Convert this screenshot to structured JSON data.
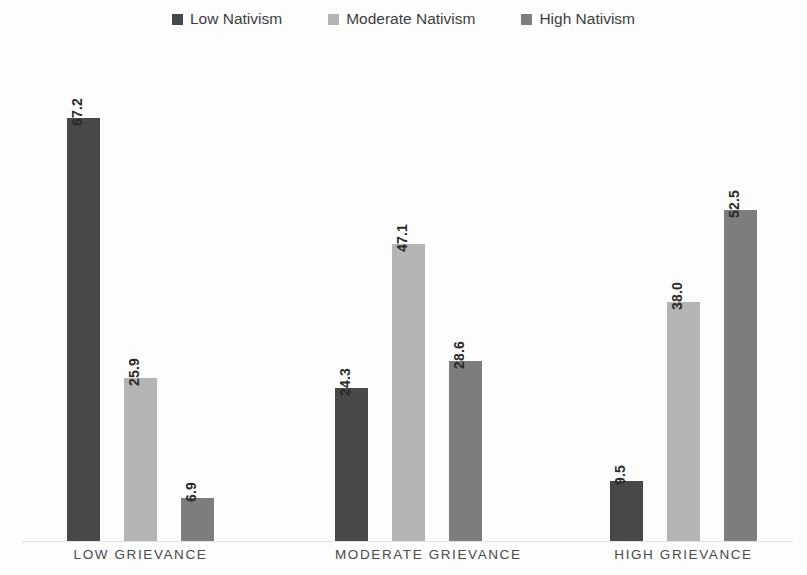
{
  "chart_data": {
    "type": "bar",
    "title": "",
    "subtitle": "",
    "xlabel": "",
    "ylabel": "",
    "grid": false,
    "legend_position": "top-center",
    "value_label_rotation": "vertical",
    "ylim": [
      0,
      70
    ],
    "categories": [
      "LOW GRIEVANCE",
      "MODERATE GRIEVANCE",
      "HIGH GRIEVANCE"
    ],
    "series": [
      {
        "name": "Low Nativism",
        "color": "#484848",
        "values": [
          67.2,
          24.3,
          9.5
        ],
        "value_labels": [
          "67.2",
          "24.3",
          "9.5"
        ]
      },
      {
        "name": "Moderate Nativism",
        "color": "#b4b4b4",
        "values": [
          25.9,
          47.1,
          38.0
        ],
        "value_labels": [
          "25.9",
          "47.1",
          "38.0"
        ]
      },
      {
        "name": "High Nativism",
        "color": "#7d7d7d",
        "values": [
          6.9,
          28.6,
          52.5
        ],
        "value_labels": [
          "6.9",
          "28.6",
          "52.5"
        ]
      }
    ]
  },
  "legend": {
    "items": [
      {
        "label": "Low Nativism",
        "color": "#484848"
      },
      {
        "label": "Moderate Nativism",
        "color": "#b4b4b4"
      },
      {
        "label": "High Nativism",
        "color": "#7d7d7d"
      }
    ]
  },
  "axis": {
    "categories": [
      "LOW GRIEVANCE",
      "MODERATE GRIEVANCE",
      "HIGH GRIEVANCE"
    ]
  }
}
